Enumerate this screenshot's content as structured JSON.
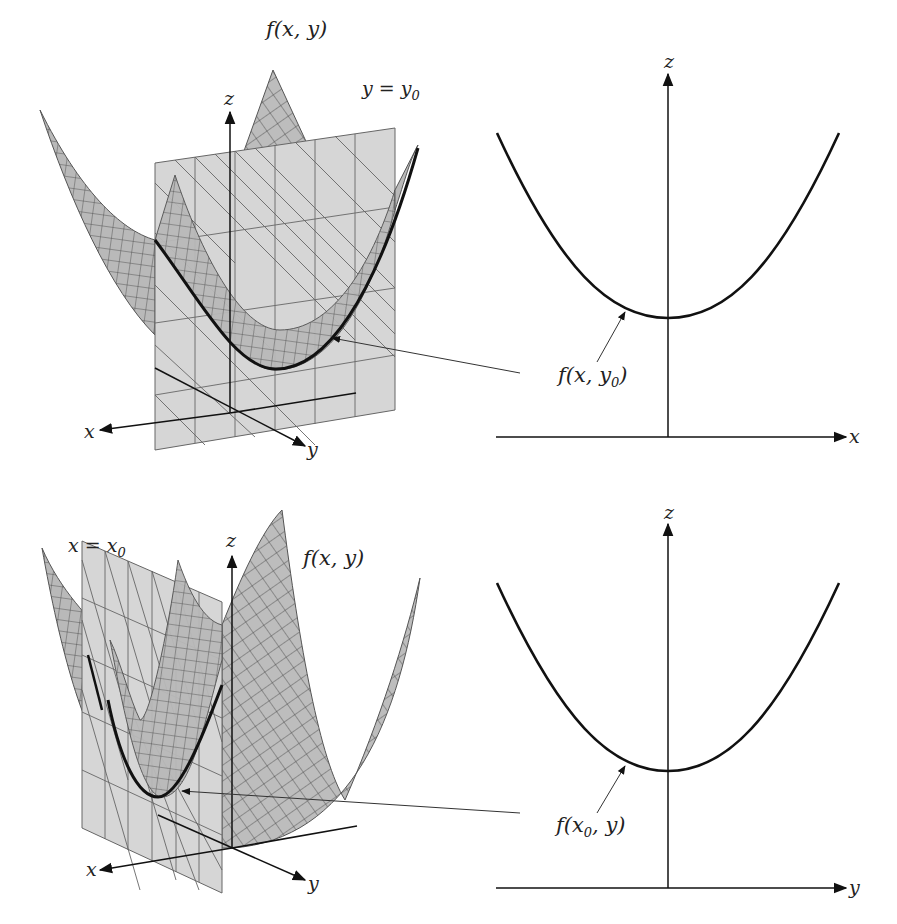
{
  "figure": {
    "top_left": {
      "surface_label": "f(x, y)",
      "plane_label_main": "y = y",
      "plane_label_sub": "0",
      "axes": {
        "x": "x",
        "y": "y",
        "z": "z"
      }
    },
    "top_right": {
      "curve_label_prefix": "f(x, y",
      "curve_label_sub": "0",
      "curve_label_suffix": ")",
      "axes": {
        "horizontal": "x",
        "vertical": "z"
      }
    },
    "bottom_left": {
      "surface_label": "f(x, y)",
      "plane_label_main": "x = x",
      "plane_label_sub": "0",
      "axes": {
        "x": "x",
        "y": "y",
        "z": "z"
      }
    },
    "bottom_right": {
      "curve_label_prefix": "f(x",
      "curve_label_sub": "0",
      "curve_label_suffix": ", y)",
      "axes": {
        "horizontal": "y",
        "vertical": "z"
      }
    },
    "colors": {
      "surface_fill": "#b9b9b9",
      "plane_fill": "#d6d6d6",
      "grid_line": "#555555",
      "curve": "#111111",
      "axis": "#111111"
    }
  }
}
